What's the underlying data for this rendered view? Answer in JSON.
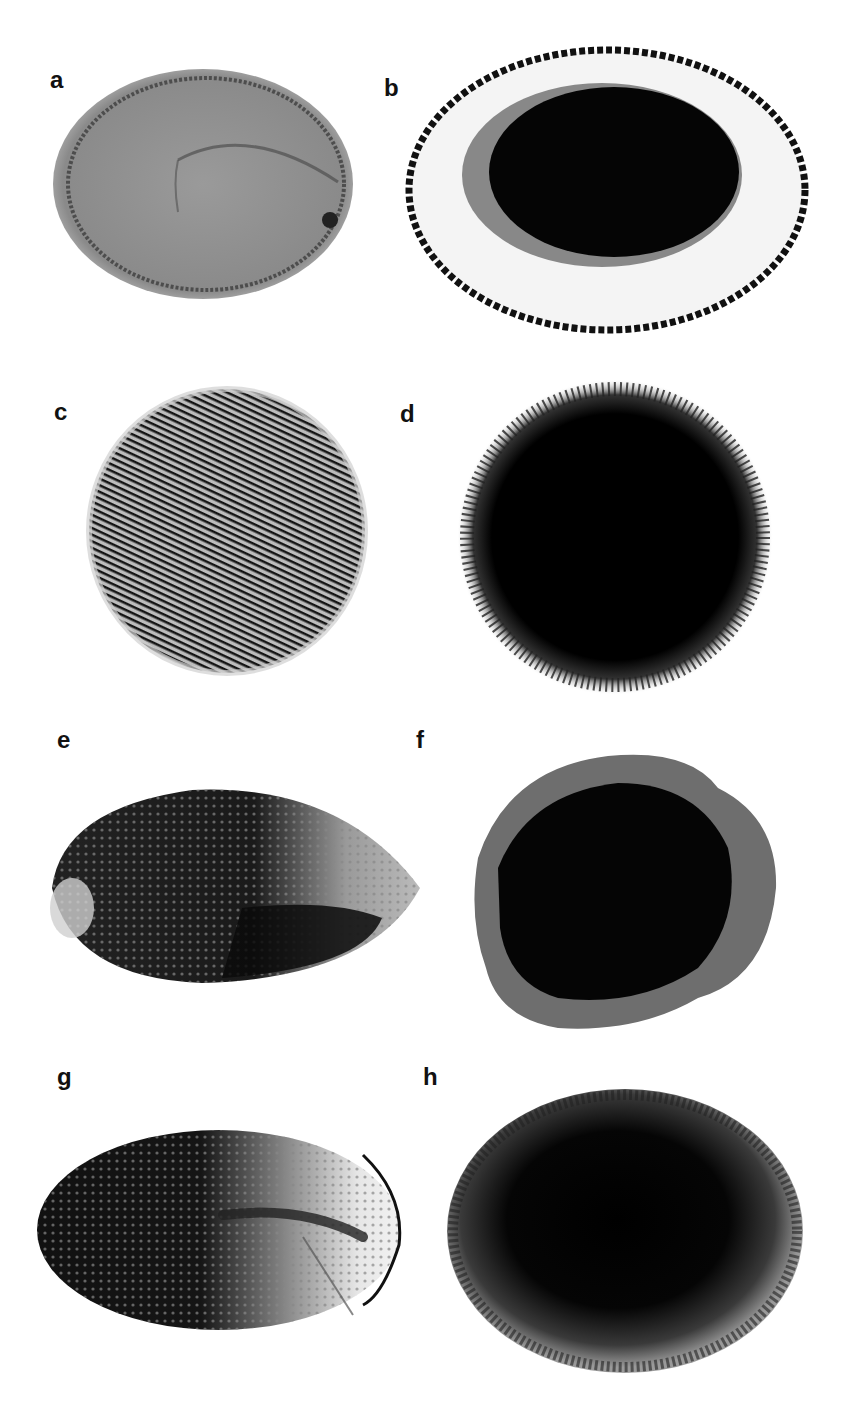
{
  "figure": {
    "panels": [
      {
        "label": "a",
        "description": "grey oval seed section with faint inner embryo outline"
      },
      {
        "label": "b",
        "description": "oval seed with white ring and dark black interior"
      },
      {
        "label": "c",
        "description": "round seed with striated/streaked dark texture"
      },
      {
        "label": "d",
        "description": "round dark seed with fuzzy radiating edge"
      },
      {
        "label": "e",
        "description": "elongated seed, dark speckled with lighter right region"
      },
      {
        "label": "f",
        "description": "irregular rounded dark seed with lighter rim"
      },
      {
        "label": "g",
        "description": "elongated oval seed, dark speckled left, light right tip"
      },
      {
        "label": "h",
        "description": "oval dark seed with fuzzy granular edge"
      }
    ]
  }
}
